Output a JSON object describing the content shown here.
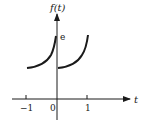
{
  "figure": {
    "y_axis_label": "f(t)",
    "x_axis_label": "t",
    "value_label": "e",
    "ticks": [
      {
        "label": "−1",
        "value": -1
      },
      {
        "label": "0",
        "value": 0
      },
      {
        "label": "1",
        "value": 1
      }
    ],
    "colors": {
      "ink": "#1a1a1a",
      "background": "#ffffff"
    }
  }
}
